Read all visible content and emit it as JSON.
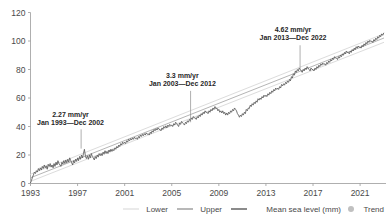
{
  "chart_data": {
    "type": "line",
    "title": "",
    "xlabel": "",
    "ylabel": "",
    "xlim": [
      1993.0,
      2023.2
    ],
    "ylim": [
      0,
      120
    ],
    "grid": false,
    "legend_position": "bottom-right",
    "y_ticks": [
      "0",
      "20",
      "40",
      "60",
      "80",
      "100",
      "120"
    ],
    "y_tick_values": [
      0,
      20,
      40,
      60,
      80,
      100,
      120
    ],
    "x_ticks": [
      "1993",
      "1997",
      "2001",
      "2005",
      "2009",
      "2013",
      "2017",
      "2021"
    ],
    "x_tick_values": [
      1993,
      1997,
      2001,
      2005,
      2009,
      2013,
      2017,
      2021
    ],
    "series": [
      {
        "name": "Mean sea level (mm)",
        "color": "#5a5a5a",
        "x": [
          1993.0,
          1993.08,
          1993.17,
          1993.25,
          1993.33,
          1993.42,
          1993.5,
          1993.58,
          1993.67,
          1993.75,
          1993.83,
          1993.92,
          1994.0,
          1994.08,
          1994.17,
          1994.25,
          1994.33,
          1994.42,
          1994.5,
          1994.58,
          1994.67,
          1994.75,
          1994.83,
          1994.92,
          1995.0,
          1995.08,
          1995.17,
          1995.25,
          1995.33,
          1995.42,
          1995.5,
          1995.58,
          1995.67,
          1995.75,
          1995.83,
          1995.92,
          1996.0,
          1996.08,
          1996.17,
          1996.25,
          1996.33,
          1996.42,
          1996.5,
          1996.58,
          1996.67,
          1996.75,
          1996.83,
          1996.92,
          1997.0,
          1997.08,
          1997.17,
          1997.25,
          1997.33,
          1997.42,
          1997.5,
          1997.58,
          1997.67,
          1997.75,
          1997.83,
          1997.92,
          1998.0,
          1998.08,
          1998.17,
          1998.25,
          1998.33,
          1998.42,
          1998.5,
          1998.58,
          1998.67,
          1998.75,
          1998.83,
          1998.92,
          1999.0,
          1999.08,
          1999.17,
          1999.25,
          1999.33,
          1999.42,
          1999.5,
          1999.58,
          1999.67,
          1999.75,
          1999.83,
          1999.92,
          2000.0,
          2000.08,
          2000.17,
          2000.25,
          2000.33,
          2000.42,
          2000.5,
          2000.58,
          2000.67,
          2000.75,
          2000.83,
          2000.92,
          2001.0,
          2001.08,
          2001.17,
          2001.25,
          2001.33,
          2001.42,
          2001.5,
          2001.58,
          2001.67,
          2001.75,
          2001.83,
          2001.92,
          2002.0,
          2002.08,
          2002.17,
          2002.25,
          2002.33,
          2002.42,
          2002.5,
          2002.58,
          2002.67,
          2002.75,
          2002.83,
          2002.92,
          2003.0,
          2003.08,
          2003.17,
          2003.25,
          2003.33,
          2003.42,
          2003.5,
          2003.58,
          2003.67,
          2003.75,
          2003.83,
          2003.92,
          2004.0,
          2004.08,
          2004.17,
          2004.25,
          2004.33,
          2004.42,
          2004.5,
          2004.58,
          2004.67,
          2004.75,
          2004.83,
          2004.92,
          2005.0,
          2005.08,
          2005.17,
          2005.25,
          2005.33,
          2005.42,
          2005.5,
          2005.58,
          2005.67,
          2005.75,
          2005.83,
          2005.92,
          2006.0,
          2006.08,
          2006.17,
          2006.25,
          2006.33,
          2006.42,
          2006.5,
          2006.58,
          2006.67,
          2006.75,
          2006.83,
          2006.92,
          2007.0,
          2007.08,
          2007.17,
          2007.25,
          2007.33,
          2007.42,
          2007.5,
          2007.58,
          2007.67,
          2007.75,
          2007.83,
          2007.92,
          2008.0,
          2008.08,
          2008.17,
          2008.25,
          2008.33,
          2008.42,
          2008.5,
          2008.58,
          2008.67,
          2008.75,
          2008.83,
          2008.92,
          2009.0,
          2009.08,
          2009.17,
          2009.25,
          2009.33,
          2009.42,
          2009.5,
          2009.58,
          2009.67,
          2009.75,
          2009.83,
          2009.92,
          2010.0,
          2010.08,
          2010.17,
          2010.25,
          2010.33,
          2010.42,
          2010.5,
          2010.58,
          2010.67,
          2010.75,
          2010.83,
          2010.92,
          2011.0,
          2011.08,
          2011.17,
          2011.25,
          2011.33,
          2011.42,
          2011.5,
          2011.58,
          2011.67,
          2011.75,
          2011.83,
          2011.92,
          2012.0,
          2012.08,
          2012.17,
          2012.25,
          2012.33,
          2012.42,
          2012.5,
          2012.58,
          2012.67,
          2012.75,
          2012.83,
          2012.92,
          2013.0,
          2013.08,
          2013.17,
          2013.25,
          2013.33,
          2013.42,
          2013.5,
          2013.58,
          2013.67,
          2013.75,
          2013.83,
          2013.92,
          2014.0,
          2014.08,
          2014.17,
          2014.25,
          2014.33,
          2014.42,
          2014.5,
          2014.58,
          2014.67,
          2014.75,
          2014.83,
          2014.92,
          2015.0,
          2015.08,
          2015.17,
          2015.25,
          2015.33,
          2015.42,
          2015.5,
          2015.58,
          2015.67,
          2015.75,
          2015.83,
          2015.92,
          2016.0,
          2016.08,
          2016.17,
          2016.25,
          2016.33,
          2016.42,
          2016.5,
          2016.58,
          2016.67,
          2016.75,
          2016.83,
          2016.92,
          2017.0,
          2017.08,
          2017.17,
          2017.25,
          2017.33,
          2017.42,
          2017.5,
          2017.58,
          2017.67,
          2017.75,
          2017.83,
          2017.92,
          2018.0,
          2018.08,
          2018.17,
          2018.25,
          2018.33,
          2018.42,
          2018.5,
          2018.58,
          2018.67,
          2018.75,
          2018.83,
          2018.92,
          2019.0,
          2019.08,
          2019.17,
          2019.25,
          2019.33,
          2019.42,
          2019.5,
          2019.58,
          2019.67,
          2019.75,
          2019.83,
          2019.92,
          2020.0,
          2020.08,
          2020.17,
          2020.25,
          2020.33,
          2020.42,
          2020.5,
          2020.58,
          2020.67,
          2020.75,
          2020.83,
          2020.92,
          2021.0,
          2021.08,
          2021.17,
          2021.25,
          2021.33,
          2021.42,
          2021.5,
          2021.58,
          2021.67,
          2021.75,
          2021.83,
          2021.92,
          2022.0,
          2022.08,
          2022.17,
          2022.25,
          2022.33,
          2022.42,
          2022.5,
          2022.58,
          2022.67,
          2022.75,
          2022.83,
          2022.92,
          2023.0
        ],
        "y": [
          0.5,
          2.0,
          4.5,
          6.0,
          8.0,
          7.0,
          9.0,
          8.0,
          10.5,
          9.0,
          11.0,
          9.5,
          12.0,
          10.5,
          13.0,
          11.0,
          12.5,
          10.0,
          13.5,
          12.0,
          14.0,
          11.5,
          13.0,
          11.0,
          14.0,
          12.0,
          15.0,
          13.0,
          16.0,
          14.0,
          13.0,
          12.0,
          15.0,
          13.5,
          16.0,
          14.0,
          16.5,
          14.5,
          17.0,
          15.0,
          18.0,
          16.0,
          14.5,
          13.0,
          16.0,
          14.5,
          17.0,
          15.5,
          18.0,
          16.0,
          19.0,
          17.0,
          20.0,
          18.0,
          21.0,
          24.0,
          19.0,
          17.5,
          19.5,
          17.0,
          20.0,
          18.0,
          21.0,
          19.0,
          18.0,
          16.5,
          19.0,
          17.5,
          20.0,
          18.5,
          21.0,
          19.5,
          21.0,
          19.5,
          22.0,
          20.5,
          23.0,
          21.0,
          22.5,
          21.0,
          23.5,
          22.0,
          24.0,
          22.5,
          24.0,
          23.0,
          25.0,
          24.0,
          26.0,
          25.0,
          27.0,
          26.0,
          28.0,
          27.0,
          29.0,
          28.0,
          29.0,
          28.0,
          30.0,
          29.0,
          31.0,
          30.0,
          31.5,
          30.5,
          32.0,
          31.0,
          32.5,
          31.5,
          32.0,
          31.0,
          33.0,
          32.0,
          34.0,
          33.0,
          34.5,
          33.5,
          35.0,
          34.0,
          35.5,
          34.5,
          35.0,
          34.0,
          36.0,
          35.0,
          37.0,
          36.0,
          38.0,
          37.0,
          38.5,
          37.5,
          39.0,
          38.0,
          38.0,
          37.0,
          39.0,
          38.0,
          40.0,
          39.0,
          40.5,
          39.0,
          41.0,
          40.0,
          41.5,
          40.5,
          41.0,
          40.0,
          42.0,
          41.0,
          43.0,
          42.0,
          41.0,
          40.0,
          42.5,
          41.5,
          43.5,
          42.5,
          42.0,
          41.0,
          43.0,
          42.0,
          44.0,
          43.0,
          45.0,
          44.0,
          46.0,
          45.0,
          47.0,
          46.0,
          46.0,
          45.0,
          47.0,
          46.0,
          48.0,
          47.0,
          49.0,
          48.0,
          50.0,
          49.0,
          51.0,
          50.0,
          50.0,
          49.0,
          51.0,
          50.0,
          52.0,
          51.0,
          53.0,
          52.0,
          54.0,
          52.5,
          53.0,
          51.0,
          52.0,
          50.0,
          51.0,
          49.5,
          51.0,
          49.0,
          50.0,
          48.0,
          49.5,
          48.0,
          50.0,
          49.0,
          51.0,
          50.0,
          52.0,
          51.0,
          53.0,
          52.0,
          51.0,
          49.0,
          48.0,
          46.5,
          48.0,
          47.0,
          49.0,
          48.0,
          50.0,
          49.0,
          52.0,
          51.0,
          53.0,
          52.5,
          55.0,
          54.0,
          56.0,
          55.0,
          57.0,
          56.0,
          58.0,
          57.0,
          59.5,
          58.5,
          60.0,
          59.0,
          61.0,
          60.0,
          62.0,
          61.0,
          62.0,
          61.0,
          63.0,
          62.0,
          64.0,
          63.0,
          65.0,
          64.0,
          66.0,
          65.0,
          67.0,
          66.0,
          67.0,
          66.0,
          68.0,
          67.0,
          69.5,
          68.5,
          70.0,
          69.0,
          71.0,
          70.0,
          72.0,
          71.0,
          73.0,
          72.0,
          75.0,
          74.0,
          77.0,
          76.0,
          79.0,
          78.0,
          80.0,
          79.0,
          81.0,
          80.0,
          79.0,
          78.0,
          80.0,
          79.0,
          81.0,
          80.0,
          82.0,
          81.0,
          80.0,
          79.0,
          81.0,
          80.0,
          80.0,
          79.0,
          81.0,
          80.0,
          82.0,
          81.0,
          83.0,
          82.0,
          84.0,
          83.0,
          84.5,
          83.5,
          84.0,
          83.0,
          85.0,
          84.0,
          86.0,
          85.0,
          87.0,
          86.0,
          88.0,
          87.0,
          89.0,
          88.0,
          88.0,
          87.0,
          89.0,
          88.0,
          90.0,
          89.0,
          91.0,
          90.0,
          92.0,
          91.0,
          93.0,
          92.0,
          92.0,
          91.0,
          93.0,
          92.0,
          94.0,
          93.0,
          95.0,
          94.0,
          96.0,
          95.0,
          96.5,
          95.5,
          96.0,
          95.0,
          97.0,
          96.0,
          98.0,
          97.0,
          99.0,
          98.0,
          100.0,
          99.0,
          100.5,
          99.5,
          100.0,
          99.0,
          101.0,
          100.0,
          102.0,
          101.0,
          103.0,
          102.0,
          104.0,
          103.0,
          105.0,
          104.0,
          105.5
        ]
      },
      {
        "name": "Trend",
        "color": "#b5b5b5",
        "x": [
          1993.0,
          2023.0
        ],
        "y": [
          4.0,
          102.0
        ]
      },
      {
        "name": "Lower",
        "color": "#dcdcdc",
        "x": [
          1993.0,
          2023.0
        ],
        "y": [
          1.5,
          99.0
        ]
      },
      {
        "name": "Upper",
        "color": "#dcdcdc",
        "x": [
          1993.0,
          2023.0
        ],
        "y": [
          6.5,
          105.0
        ]
      }
    ],
    "annotations": [
      {
        "name": "annotation-1993-2002",
        "rate": "2.27 mm/yr",
        "period": "Jan 1993—Dec 2002",
        "text_x": 1996.4,
        "text_y": 47.0,
        "leader_x": 1997.3,
        "leader_y_top": 38.0,
        "leader_y_bottom": 24.5
      },
      {
        "name": "annotation-2003-2012",
        "rate": "3.3 mm/yr",
        "period": "Jan 2003—Dec 2012",
        "text_x": 2005.9,
        "text_y": 74.0,
        "leader_x": 2006.6,
        "leader_y_top": 65.0,
        "leader_y_bottom": 43.0
      },
      {
        "name": "annotation-2013-2022",
        "rate": "4.62 mm/yr",
        "period": "Jan 2013—Dec 2022",
        "text_x": 2015.3,
        "text_y": 106.0,
        "leader_x": 2015.9,
        "leader_y_top": 97.0,
        "leader_y_bottom": 80.0
      }
    ],
    "legend": [
      {
        "label": "Lower",
        "kind": "line",
        "color": "#dcdcdc"
      },
      {
        "label": "Upper",
        "kind": "line",
        "color": "#9a9a9a"
      },
      {
        "label": "Mean sea level (mm)",
        "kind": "line",
        "color": "#5a5a5a"
      },
      {
        "label": "Trend",
        "kind": "dot",
        "color": "#c0c0c0"
      }
    ]
  },
  "colors": {
    "axis": "#9a9a9a",
    "tick_label": "#4a4a4a",
    "annotation_text": "#262626",
    "background": "#ffffff"
  }
}
